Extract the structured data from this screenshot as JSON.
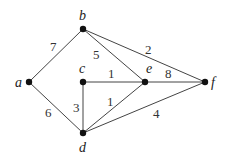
{
  "graph": {
    "nodes": [
      {
        "id": "a",
        "label": "a",
        "x": 29,
        "y": 82,
        "lx": 15,
        "ly": 87
      },
      {
        "id": "b",
        "label": "b",
        "x": 83,
        "y": 29,
        "lx": 79,
        "ly": 20
      },
      {
        "id": "c",
        "label": "c",
        "x": 83,
        "y": 82,
        "lx": 79,
        "ly": 73
      },
      {
        "id": "d",
        "label": "d",
        "x": 83,
        "y": 133,
        "lx": 79,
        "ly": 152
      },
      {
        "id": "e",
        "label": "e",
        "x": 145,
        "y": 82,
        "lx": 146,
        "ly": 73
      },
      {
        "id": "f",
        "label": "f",
        "x": 205,
        "y": 82,
        "lx": 211,
        "ly": 87
      }
    ],
    "edges": [
      {
        "from": "a",
        "to": "b",
        "weight": "7",
        "wx": 50,
        "wy": 51
      },
      {
        "from": "a",
        "to": "d",
        "weight": "6",
        "wx": 45,
        "wy": 117
      },
      {
        "from": "b",
        "to": "e",
        "weight": "5",
        "wx": 93,
        "wy": 59
      },
      {
        "from": "b",
        "to": "f",
        "weight": "2",
        "wx": 145,
        "wy": 54
      },
      {
        "from": "c",
        "to": "e",
        "weight": "1",
        "wx": 108,
        "wy": 78
      },
      {
        "from": "e",
        "to": "f",
        "weight": "8",
        "wx": 165,
        "wy": 78
      },
      {
        "from": "c",
        "to": "d",
        "weight": "3",
        "wx": 73,
        "wy": 112
      },
      {
        "from": "d",
        "to": "e",
        "weight": "1",
        "wx": 107,
        "wy": 106
      },
      {
        "from": "d",
        "to": "f",
        "weight": "4",
        "wx": 153,
        "wy": 118
      }
    ]
  }
}
